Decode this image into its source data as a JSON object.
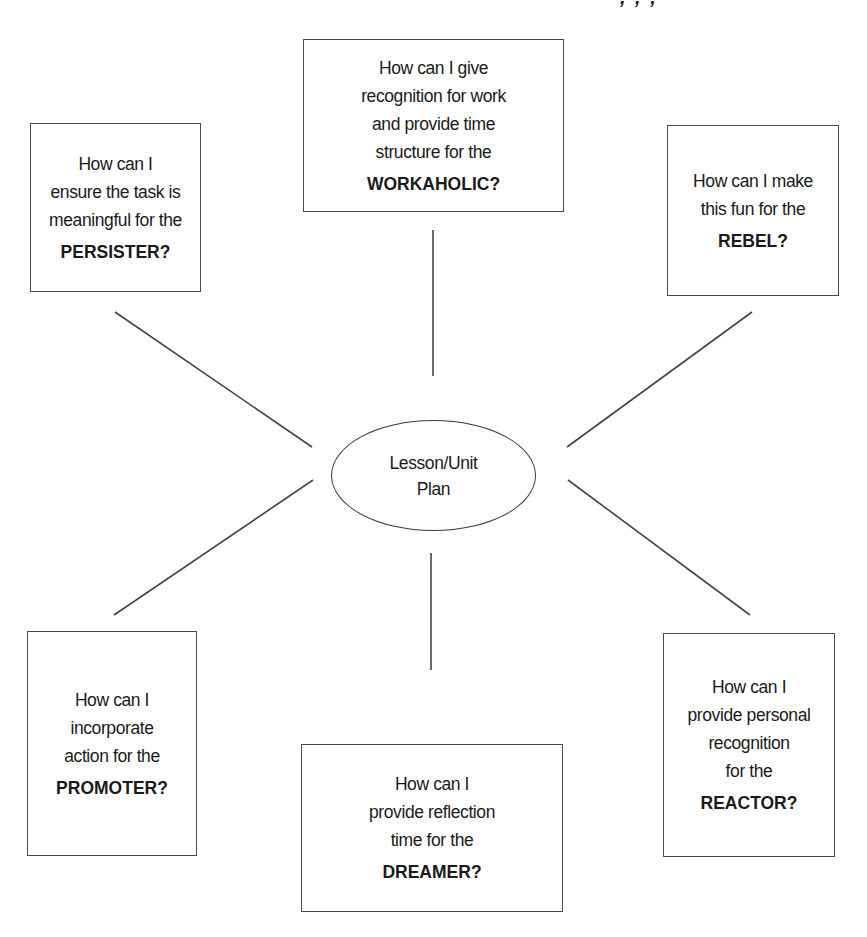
{
  "header_fragment": ", , ,",
  "center": {
    "label": "Lesson/Unit\nPlan"
  },
  "boxes": {
    "workaholic": {
      "question": "How can I give\nrecognition for work\nand provide time\nstructure for the",
      "type": "WORKAHOLIC?"
    },
    "persister": {
      "question": "How can I\nensure the task is\nmeaningful for the",
      "type": "PERSISTER?"
    },
    "rebel": {
      "question": "How can I make\nthis fun for the",
      "type": "REBEL?"
    },
    "promoter": {
      "question": "How can I\nincorporate\naction for the",
      "type": "PROMOTER?"
    },
    "dreamer": {
      "question": "How can I\nprovide reflection\ntime for the",
      "type": "DREAMER?"
    },
    "reactor": {
      "question": "How can I\nprovide personal\nrecognition\nfor the",
      "type": "REACTOR?"
    }
  },
  "colors": {
    "line": "#444444",
    "border": "#4a4a4a",
    "text": "#1a1a1a",
    "background": "#ffffff"
  }
}
